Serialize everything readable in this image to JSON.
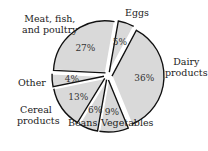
{
  "chart_data": {
    "type": "pie",
    "title": "",
    "exploded": true,
    "start_angle_deg": 10,
    "direction": "clockwise",
    "categories": [
      "Eggs",
      "Dairy products",
      "Vegetables",
      "Beans",
      "Cereal products",
      "Other",
      "Meat, fish, and poultry"
    ],
    "values": [
      5,
      36,
      9,
      6,
      13,
      4,
      27
    ],
    "value_labels": [
      "5%",
      "36%",
      "9%",
      "6%",
      "13%",
      "4%",
      "27%"
    ],
    "fill_color": "#d9d9d9",
    "edge_color": "#111111"
  },
  "labels": {
    "eggs": "Eggs",
    "dairy_1": "Dairy",
    "dairy_2": "products",
    "vegetables": "Vegetables",
    "beans": "Beans",
    "cereal_1": "Cereal",
    "cereal_2": "products",
    "other": "Other",
    "meat_1": "Meat, fish,",
    "meat_2": "and poultry"
  }
}
